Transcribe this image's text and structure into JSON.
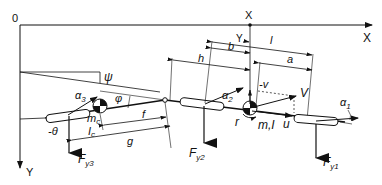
{
  "diagram": {
    "axes": {
      "origin": "0",
      "x_axis": "X",
      "y_axis": "Y",
      "local_x": "X",
      "local_y": "Y"
    },
    "angles": {
      "psi": "ψ",
      "phi": "φ",
      "theta": "-θ",
      "alpha1": "α",
      "alpha1_sub": "1",
      "alpha2": "α",
      "alpha2_sub": "2",
      "alpha3": "α",
      "alpha3_sub": "3"
    },
    "dimensions": {
      "l": "l",
      "a": "a",
      "b": "b",
      "h": "h",
      "f": "f",
      "g": "g"
    },
    "tractor": {
      "mass_inertia": "m,I",
      "yaw_rate": "r",
      "velocity": "V",
      "lateral_velocity": "-v",
      "longitudinal_velocity": "u"
    },
    "trailer": {
      "mass": "m",
      "mass_sub": "c",
      "inertia": "I",
      "inertia_sub": "c"
    },
    "forces": {
      "fy1": "F",
      "fy1_sub": "y1",
      "fy2": "F",
      "fy2_sub": "y2",
      "fy3": "F",
      "fy3_sub": "y3"
    },
    "colors": {
      "line": "#111111",
      "background": "#ffffff"
    }
  }
}
